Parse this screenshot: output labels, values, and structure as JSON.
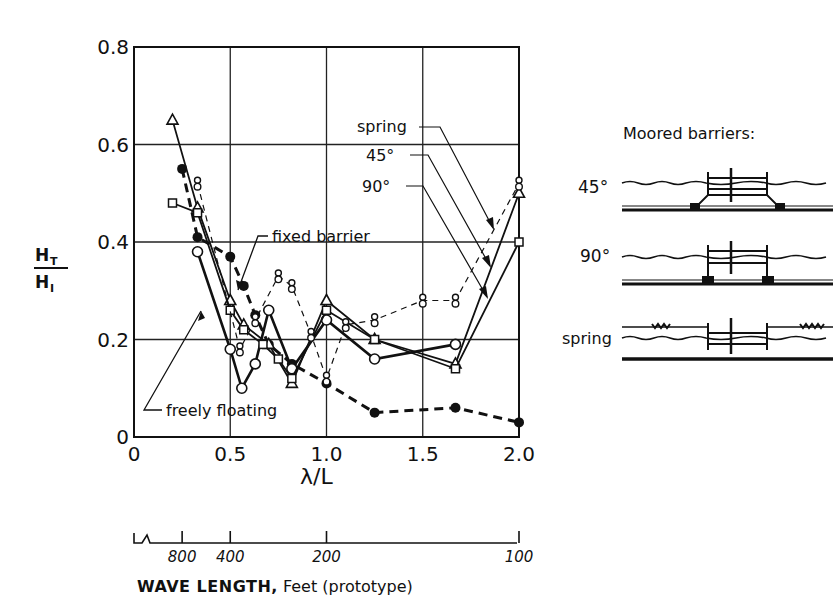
{
  "chart_data": {
    "type": "line",
    "title": "",
    "xlabel": "λ/L",
    "ylabel": "H_T / H_I",
    "ylabel_num": "H",
    "ylabel_num_sub": "T",
    "ylabel_den": "H",
    "ylabel_den_sub": "I",
    "xlim": [
      0,
      2.0
    ],
    "ylim": [
      0,
      0.8
    ],
    "grid": true,
    "x_ticks": [
      0,
      0.5,
      1.0,
      1.5,
      2.0
    ],
    "x_tick_labels": [
      "0",
      "0.5",
      "1.0",
      "1.5",
      "2.0"
    ],
    "y_ticks": [
      0,
      0.2,
      0.4,
      0.6,
      0.8
    ],
    "y_tick_labels": [
      "0",
      "0.2",
      "0.4",
      "0.6",
      "0.8"
    ],
    "series": [
      {
        "name": "fixed barrier",
        "marker": "filled-circle",
        "line": "heavy-dashed",
        "x": [
          0.25,
          0.33,
          0.5,
          0.57,
          0.63,
          0.7,
          0.82,
          1.0,
          1.25,
          1.67,
          2.0
        ],
        "y": [
          0.55,
          0.41,
          0.37,
          0.31,
          0.25,
          0.19,
          0.15,
          0.11,
          0.05,
          0.06,
          0.03
        ]
      },
      {
        "name": "freely floating",
        "marker": "open-circle",
        "line": "solid-heavy",
        "x": [
          0.33,
          0.5,
          0.56,
          0.63,
          0.7,
          0.82,
          1.0,
          1.25,
          1.67
        ],
        "y": [
          0.38,
          0.18,
          0.1,
          0.15,
          0.26,
          0.14,
          0.24,
          0.16,
          0.19
        ]
      },
      {
        "name": "45°",
        "marker": "open-triangle",
        "line": "solid",
        "x": [
          0.2,
          0.33,
          0.5,
          0.57,
          0.7,
          0.82,
          1.0,
          1.25,
          1.67,
          2.0
        ],
        "y": [
          0.65,
          0.47,
          0.28,
          0.23,
          0.19,
          0.11,
          0.28,
          0.2,
          0.15,
          0.5
        ]
      },
      {
        "name": "90°",
        "marker": "open-square",
        "line": "solid",
        "x": [
          0.2,
          0.33,
          0.5,
          0.57,
          0.67,
          0.75,
          0.82,
          1.0,
          1.25,
          1.67,
          2.0
        ],
        "y": [
          0.48,
          0.46,
          0.26,
          0.22,
          0.19,
          0.16,
          0.12,
          0.26,
          0.2,
          0.14,
          0.4
        ]
      },
      {
        "name": "spring",
        "marker": "figure-eight",
        "line": "thin-dashed",
        "x": [
          0.33,
          0.55,
          0.63,
          0.75,
          0.82,
          0.92,
          1.0,
          1.1,
          1.25,
          1.5,
          1.67,
          2.0
        ],
        "y": [
          0.52,
          0.18,
          0.24,
          0.33,
          0.31,
          0.21,
          0.12,
          0.23,
          0.24,
          0.28,
          0.28,
          0.52
        ]
      }
    ],
    "annotations": [
      {
        "text": "fixed barrier",
        "points_to": "fixed barrier"
      },
      {
        "text": "freely floating",
        "points_to": "freely floating"
      },
      {
        "text": "spring",
        "points_to": "spring"
      },
      {
        "text": "45°",
        "points_to": "45°"
      },
      {
        "text": "90°",
        "points_to": "90°"
      }
    ],
    "secondary_axis": {
      "label_bold": "WAVE LENGTH,",
      "label_rest": " Feet (prototype)",
      "ticks": [
        {
          "label": "800",
          "x": 0.25
        },
        {
          "label": "400",
          "x": 0.5
        },
        {
          "label": "200",
          "x": 1.0
        },
        {
          "label": "100",
          "x": 2.0
        }
      ]
    }
  },
  "diagram": {
    "title": "Moored barriers:",
    "items": [
      {
        "label": "45°",
        "type": "45-degree mooring"
      },
      {
        "label": "90°",
        "type": "90-degree mooring"
      },
      {
        "label": "spring",
        "type": "spring mooring"
      }
    ]
  },
  "colors": {
    "ink": "#111111",
    "background": "#ffffff",
    "grid": "#222222"
  }
}
